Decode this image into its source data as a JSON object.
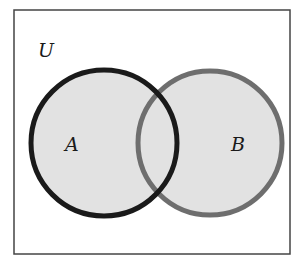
{
  "diagram": {
    "type": "venn",
    "universe_label": "U",
    "sets": [
      {
        "label": "A",
        "stroke": "#1a1a1a",
        "fill": "#e2e2e2"
      },
      {
        "label": "B",
        "stroke": "#6e6e6e",
        "fill": "#e2e2e2"
      }
    ],
    "border_color": "#444444"
  }
}
